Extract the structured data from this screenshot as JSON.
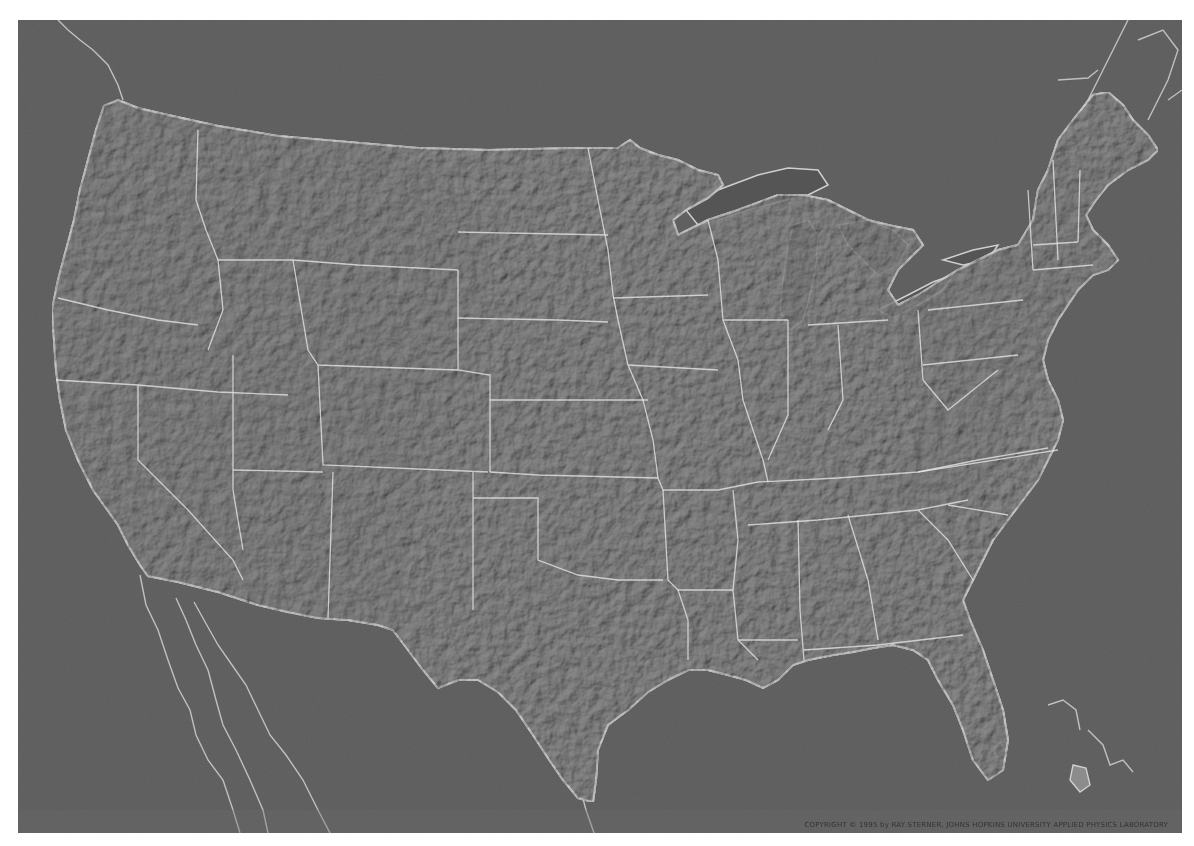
{
  "map": {
    "title": "Shaded relief map of the contiguous United States",
    "style": "grayscale shaded relief",
    "colors": {
      "water": "#5b5b5b",
      "land": "#8c8c8c",
      "borders": "#e4e4e4",
      "page_background": "#ffffff"
    },
    "copyright": "COPYRIGHT © 1995 by RAY STERNER, JOHNS HOPKINS UNIVERSITY APPLIED PHYSICS LABORATORY"
  }
}
